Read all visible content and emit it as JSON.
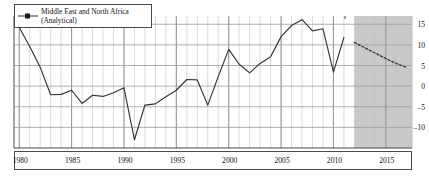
{
  "figure": {
    "legend": {
      "line1": "Middle East and North Africa",
      "line2": "(Analytical)",
      "marker_icon": "line-marker-icon"
    }
  },
  "chart_data": {
    "type": "line",
    "title": "",
    "subtitle": "",
    "xlabel": "",
    "ylabel": "",
    "xlim": [
      1979.5,
      2017.5
    ],
    "ylim": [
      -15,
      17
    ],
    "grid": true,
    "grid_minor_x": true,
    "legend_position": "top-left",
    "y_ticks": [
      15,
      10,
      5,
      0,
      -5,
      -10
    ],
    "y_tick_labels": [
      "15",
      "10",
      "5",
      "0",
      "–5",
      "–10"
    ],
    "x_ticks": [
      1980,
      1985,
      1990,
      1995,
      2000,
      2005,
      2010,
      2015
    ],
    "x_tick_labels": [
      "1980",
      "1985",
      "1990",
      "1995",
      "2000",
      "2005",
      "2010",
      "2015"
    ],
    "shaded_forecast_region": {
      "start": 2012,
      "end": 2017.5,
      "color": "#c9c9c9",
      "label": ""
    },
    "series": [
      {
        "name": "Middle East and North Africa (Analytical)",
        "style": "solid",
        "color": "#333333",
        "x": [
          1980,
          1981,
          1982,
          1983,
          1984,
          1985,
          1986,
          1987,
          1988,
          1989,
          1990,
          1991,
          1992,
          1993,
          1994,
          1995,
          1996,
          1997,
          1998,
          1999,
          2000,
          2001,
          2002,
          2003,
          2004,
          2005,
          2006,
          2007,
          2008,
          2009,
          2010,
          2011
        ],
        "values": [
          14.2,
          9.6,
          4.6,
          -2.1,
          -2.0,
          -1.0,
          -4.2,
          -2.2,
          -2.5,
          -1.6,
          -0.4,
          -13.0,
          -4.6,
          -4.3,
          -2.6,
          -1.0,
          1.6,
          1.5,
          -4.6,
          2.3,
          8.9,
          5.3,
          3.2,
          5.5,
          7.1,
          12.0,
          14.7,
          16.1,
          13.4,
          13.9,
          3.4,
          11.8
        ]
      },
      {
        "name": "Middle East and North Africa (Analytical) projection",
        "style": "dashed",
        "color": "#333333",
        "x": [
          2012,
          2013,
          2014,
          2015,
          2016,
          2017
        ],
        "values": [
          10.6,
          9.3,
          8.0,
          6.7,
          5.5,
          4.5
        ]
      }
    ]
  }
}
